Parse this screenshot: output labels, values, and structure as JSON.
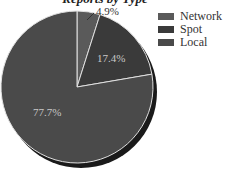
{
  "chart_data": {
    "type": "pie",
    "title": "Reports by Type",
    "categories": [
      "Network",
      "Spot",
      "Local"
    ],
    "values": [
      4.9,
      17.4,
      77.7
    ],
    "labels": [
      "4.9%",
      "17.4%",
      "77.7%"
    ],
    "colors": [
      "#5a5a5a",
      "#3a3a3a",
      "#4a4a4a"
    ],
    "legend_position": "right",
    "start_angle_deg": 0,
    "direction": "clockwise"
  },
  "legend": [
    {
      "label": "Network",
      "color": "#5a5a5a"
    },
    {
      "label": "Spot",
      "color": "#3a3a3a"
    },
    {
      "label": "Local",
      "color": "#4a4a4a"
    }
  ]
}
